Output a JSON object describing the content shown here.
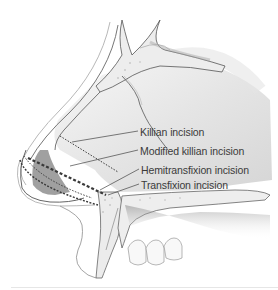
{
  "figure": {
    "labels": [
      {
        "id": "killian",
        "text": "Killian incision",
        "x": 140,
        "y": 126
      },
      {
        "id": "modified-killian",
        "text": "Modified killian incision",
        "x": 140,
        "y": 145
      },
      {
        "id": "hemitransfixion",
        "text": "Hemitransfixion incision",
        "x": 141,
        "y": 164
      },
      {
        "id": "transfixion",
        "text": "Transfixion incision",
        "x": 141,
        "y": 179
      }
    ],
    "colors": {
      "line": "#3a3a3a",
      "bone": "#efefef",
      "shade": "#bdbdbd",
      "background": "#ffffff"
    }
  }
}
